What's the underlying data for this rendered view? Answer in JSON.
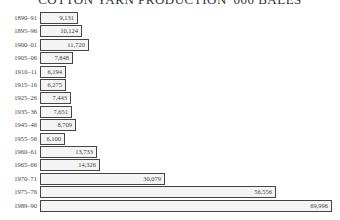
{
  "title": "COTTON YARN PRODUCTION '000 BALES",
  "chart_data": {
    "type": "bar",
    "orientation": "horizontal",
    "title": "COTTON YARN PRODUCTION '000 BALES",
    "xlabel": "",
    "ylabel": "",
    "categories": [
      "1890–91",
      "1895–96",
      "1900–01",
      "1905–06",
      "1910–11",
      "1915–16",
      "1925–26",
      "1935–36",
      "1945–46",
      "1955–56",
      "1960–61",
      "1965–66",
      "1970–71",
      "1975–76",
      "1989–90"
    ],
    "values": [
      9131,
      10124,
      11720,
      7848,
      6194,
      6275,
      7443,
      7651,
      8709,
      6100,
      13733,
      14326,
      30079,
      56556,
      69996
    ],
    "value_labels": [
      "9,131",
      "10,124",
      "11,720",
      "7,848",
      "6,194",
      "6,275",
      "7,443",
      "7,651",
      "8,709",
      "6,100",
      "13,733",
      "14,326",
      "30,079",
      "56,556",
      "69,996"
    ],
    "grid": false,
    "legend": null,
    "bar_fill": "#f4f4f4",
    "bar_stroke": "#444444"
  }
}
